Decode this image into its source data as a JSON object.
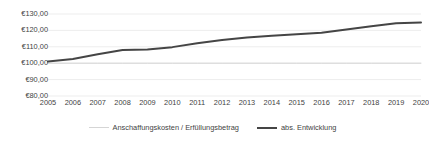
{
  "chart_data": {
    "type": "line",
    "title": "",
    "xlabel": "",
    "ylabel": "",
    "grid": true,
    "legend_position": "bottom",
    "ylim": [
      80,
      130
    ],
    "ytick_labels": [
      "€130,00",
      "€120,00",
      "€110,00",
      "€100,00",
      "€90,00",
      "€80,00"
    ],
    "ytick_values": [
      130,
      120,
      110,
      100,
      90,
      80
    ],
    "categories": [
      "2005",
      "2006",
      "2007",
      "2008",
      "2009",
      "2010",
      "2011",
      "2012",
      "2013",
      "2014",
      "2015",
      "2016",
      "2017",
      "2018",
      "2019",
      "2020"
    ],
    "x": [
      2005,
      2006,
      2007,
      2008,
      2009,
      2010,
      2011,
      2012,
      2013,
      2014,
      2015,
      2016,
      2017,
      2018,
      2019,
      2020
    ],
    "series": [
      {
        "name": "Anschaffungskosten / Erfüllungsbetrag",
        "color": "#d5d5d5",
        "width": 1,
        "values": [
          100,
          100,
          100,
          100,
          100,
          100,
          100,
          100,
          100,
          100,
          100,
          100,
          100,
          100,
          100,
          100
        ]
      },
      {
        "name": "abs. Entwicklung",
        "color": "#454545",
        "width": 2,
        "values": [
          101.0,
          102.6,
          105.4,
          108.1,
          108.4,
          109.8,
          112.2,
          114.2,
          115.7,
          116.8,
          117.6,
          118.5,
          120.6,
          122.6,
          124.3,
          124.8
        ]
      }
    ]
  },
  "legend": {
    "items": [
      {
        "label": "Anschaffungskosten / Erfüllungsbetrag"
      },
      {
        "label": "abs. Entwicklung"
      }
    ]
  }
}
